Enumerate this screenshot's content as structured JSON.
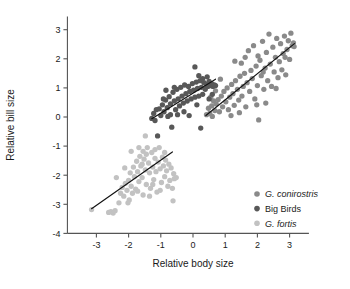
{
  "chart_data": {
    "type": "scatter",
    "title": "",
    "xlabel": "Relative body size",
    "ylabel": "Relative bill size",
    "xlim": [
      -3.9,
      3.6
    ],
    "ylim": [
      -4.0,
      3.45
    ],
    "xticks": [
      "-3",
      "-2",
      "-1",
      "0",
      "1",
      "2",
      "3"
    ],
    "xtick_values": [
      -3,
      -2,
      -1,
      0,
      1,
      2,
      3
    ],
    "yticks": [
      "3",
      "2",
      "1",
      "0",
      "-1",
      "-2",
      "-3",
      "-4"
    ],
    "ytick_values": [
      3,
      2,
      1,
      0,
      -1,
      -2,
      -3,
      -4
    ],
    "grid": false,
    "legend_position": "lower-right",
    "colors": {
      "g_conirostris": "#8a8a8a",
      "big_birds": "#585858",
      "g_fortis": "#c2c2c2",
      "fit_line": "#111111",
      "axis": "#555555"
    },
    "series": [
      {
        "name": "G. conirostris",
        "italic": true,
        "color": "#8a8a8a",
        "marker": "circle",
        "points": [
          [
            0.42,
            0.08
          ],
          [
            0.48,
            0.3
          ],
          [
            0.52,
            0.12
          ],
          [
            0.58,
            0.38
          ],
          [
            0.6,
            0.02
          ],
          [
            0.64,
            0.55
          ],
          [
            0.68,
            0.22
          ],
          [
            0.72,
            0.45
          ],
          [
            0.78,
            0.6
          ],
          [
            0.82,
            0.18
          ],
          [
            0.88,
            0.72
          ],
          [
            0.92,
            0.35
          ],
          [
            0.96,
            0.88
          ],
          [
            1.02,
            0.52
          ],
          [
            1.06,
            1.0
          ],
          [
            1.1,
            0.25
          ],
          [
            1.14,
            0.68
          ],
          [
            1.2,
            1.12
          ],
          [
            1.24,
            0.8
          ],
          [
            1.28,
            0.4
          ],
          [
            1.32,
            1.25
          ],
          [
            1.38,
            0.95
          ],
          [
            1.42,
            0.58
          ],
          [
            1.46,
            1.4
          ],
          [
            1.5,
            1.85
          ],
          [
            1.52,
            0.72
          ],
          [
            1.56,
            1.05
          ],
          [
            1.6,
            1.5
          ],
          [
            1.64,
            0.35
          ],
          [
            1.68,
            1.18
          ],
          [
            1.72,
            2.28
          ],
          [
            1.76,
            0.88
          ],
          [
            1.8,
            1.6
          ],
          [
            1.84,
            1.32
          ],
          [
            1.88,
            2.45
          ],
          [
            1.92,
            0.62
          ],
          [
            1.96,
            1.75
          ],
          [
            2.0,
            1.08
          ],
          [
            2.04,
            -0.1
          ],
          [
            2.08,
            1.95
          ],
          [
            2.12,
            1.42
          ],
          [
            2.16,
            2.6
          ],
          [
            2.2,
            0.95
          ],
          [
            2.24,
            1.68
          ],
          [
            2.28,
            2.22
          ],
          [
            2.32,
            1.25
          ],
          [
            2.36,
            2.85
          ],
          [
            2.4,
            1.82
          ],
          [
            2.44,
            1.05
          ],
          [
            2.48,
            2.4
          ],
          [
            2.52,
            1.55
          ],
          [
            2.56,
            2.05
          ],
          [
            2.6,
            2.7
          ],
          [
            2.64,
            1.35
          ],
          [
            2.68,
            1.9
          ],
          [
            2.72,
            2.52
          ],
          [
            2.76,
            1.62
          ],
          [
            2.8,
            2.18
          ],
          [
            2.84,
            2.78
          ],
          [
            2.88,
            1.45
          ],
          [
            2.92,
            2.32
          ],
          [
            2.96,
            2.62
          ],
          [
            3.0,
            1.98
          ],
          [
            3.04,
            2.88
          ],
          [
            3.08,
            2.45
          ],
          [
            3.12,
            2.55
          ],
          [
            3.14,
            2.42
          ],
          [
            1.3,
            1.92
          ],
          [
            0.85,
            1.3
          ],
          [
            1.44,
            0.15
          ],
          [
            2.02,
            2.1
          ],
          [
            2.26,
            0.48
          ],
          [
            1.18,
            0.05
          ],
          [
            0.7,
            0.9
          ],
          [
            2.58,
            0.98
          ],
          [
            1.62,
            2.05
          ],
          [
            2.18,
            1.55
          ],
          [
            0.55,
            0.68
          ],
          [
            1.98,
            0.42
          ],
          [
            2.86,
            2.05
          ]
        ]
      },
      {
        "name": "Big Birds",
        "italic": false,
        "color": "#585858",
        "marker": "circle",
        "points": [
          [
            -1.28,
            -0.05
          ],
          [
            -1.22,
            0.12
          ],
          [
            -1.18,
            -0.12
          ],
          [
            -1.1,
            -0.65
          ],
          [
            -1.05,
            0.28
          ],
          [
            -1.0,
            0.05
          ],
          [
            -0.95,
            0.42
          ],
          [
            -0.9,
            0.18
          ],
          [
            -0.85,
            0.58
          ],
          [
            -0.8,
            0.32
          ],
          [
            -0.78,
            0.02
          ],
          [
            -0.74,
            0.7
          ],
          [
            -0.7,
            0.45
          ],
          [
            -0.66,
            -0.35
          ],
          [
            -0.62,
            0.85
          ],
          [
            -0.58,
            0.55
          ],
          [
            -0.54,
            0.25
          ],
          [
            -0.5,
            0.95
          ],
          [
            -0.46,
            0.62
          ],
          [
            -0.42,
            0.38
          ],
          [
            -0.38,
            1.02
          ],
          [
            -0.34,
            0.72
          ],
          [
            -0.3,
            0.48
          ],
          [
            -0.26,
            1.1
          ],
          [
            -0.22,
            0.8
          ],
          [
            -0.18,
            0.55
          ],
          [
            -0.14,
            1.05
          ],
          [
            -0.1,
            0.88
          ],
          [
            -0.06,
            0.62
          ],
          [
            -0.02,
            1.15
          ],
          [
            0.02,
            0.92
          ],
          [
            0.06,
            0.68
          ],
          [
            0.1,
            1.2
          ],
          [
            0.14,
            0.98
          ],
          [
            0.18,
            0.72
          ],
          [
            0.22,
            1.25
          ],
          [
            0.26,
            1.02
          ],
          [
            0.3,
            0.78
          ],
          [
            0.34,
            1.18
          ],
          [
            0.38,
            0.95
          ],
          [
            0.42,
            1.12
          ],
          [
            0.46,
            1.05
          ],
          [
            0.5,
            1.22
          ],
          [
            0.54,
            1.08
          ],
          [
            0.58,
            1.15
          ],
          [
            0.62,
            1.05
          ],
          [
            0.66,
            1.1
          ],
          [
            0.7,
            1.08
          ],
          [
            0.06,
            1.72
          ],
          [
            -0.12,
            0.05
          ],
          [
            -0.48,
            0.08
          ],
          [
            -0.92,
            0.62
          ],
          [
            -0.58,
            1.02
          ],
          [
            0.18,
            1.42
          ],
          [
            0.3,
            1.32
          ],
          [
            0.44,
            1.38
          ],
          [
            -0.7,
            0.08
          ],
          [
            -0.28,
            0.18
          ],
          [
            0.12,
            0.42
          ],
          [
            0.5,
            0.62
          ],
          [
            0.24,
            -0.38
          ],
          [
            -0.84,
            0.92
          ],
          [
            -1.14,
            0.25
          ],
          [
            0.6,
            0.78
          ]
        ]
      },
      {
        "name": "G. fortis",
        "italic": true,
        "color": "#c2c2c2",
        "marker": "circle",
        "points": [
          [
            -3.15,
            -3.18
          ],
          [
            -2.62,
            -3.28
          ],
          [
            -2.55,
            -3.25
          ],
          [
            -2.48,
            -3.3
          ],
          [
            -2.42,
            -3.22
          ],
          [
            -2.3,
            -2.95
          ],
          [
            -2.25,
            -2.62
          ],
          [
            -2.2,
            -2.42
          ],
          [
            -2.15,
            -2.72
          ],
          [
            -2.1,
            -2.28
          ],
          [
            -2.05,
            -2.52
          ],
          [
            -2.0,
            -2.18
          ],
          [
            -1.98,
            -2.85
          ],
          [
            -1.95,
            -1.92
          ],
          [
            -1.92,
            -2.38
          ],
          [
            -1.88,
            -2.62
          ],
          [
            -1.85,
            -1.72
          ],
          [
            -1.82,
            -2.05
          ],
          [
            -1.78,
            -2.48
          ],
          [
            -1.75,
            -1.52
          ],
          [
            -1.72,
            -1.88
          ],
          [
            -1.68,
            -2.22
          ],
          [
            -1.65,
            -1.35
          ],
          [
            -1.62,
            -1.68
          ],
          [
            -1.58,
            -2.08
          ],
          [
            -1.55,
            -1.18
          ],
          [
            -1.52,
            -1.45
          ],
          [
            -1.48,
            -1.82
          ],
          [
            -1.45,
            -2.32
          ],
          [
            -1.42,
            -1.05
          ],
          [
            -1.38,
            -1.58
          ],
          [
            -1.35,
            -1.92
          ],
          [
            -1.32,
            -2.45
          ],
          [
            -1.28,
            -1.22
          ],
          [
            -1.25,
            -1.72
          ],
          [
            -1.22,
            -2.15
          ],
          [
            -1.18,
            -1.42
          ],
          [
            -1.15,
            -1.88
          ],
          [
            -1.12,
            -2.58
          ],
          [
            -1.08,
            -1.55
          ],
          [
            -1.05,
            -1.05
          ],
          [
            -1.02,
            -1.78
          ],
          [
            -0.98,
            -2.25
          ],
          [
            -0.95,
            -1.38
          ],
          [
            -0.92,
            -1.68
          ],
          [
            -0.88,
            -2.05
          ],
          [
            -0.85,
            -1.48
          ],
          [
            -0.82,
            -1.85
          ],
          [
            -0.78,
            -2.38
          ],
          [
            -0.75,
            -1.62
          ],
          [
            -0.72,
            -2.18
          ],
          [
            -0.68,
            -1.75
          ],
          [
            -0.64,
            -2.45
          ],
          [
            -0.6,
            -1.95
          ],
          [
            -0.58,
            -2.12
          ],
          [
            -0.62,
            -2.88
          ],
          [
            -1.48,
            -0.65
          ],
          [
            -2.12,
            -1.75
          ],
          [
            -1.92,
            -1.18
          ],
          [
            -1.55,
            -2.68
          ],
          [
            -1.35,
            -2.72
          ],
          [
            -2.38,
            -2.08
          ],
          [
            -1.68,
            -1.05
          ],
          [
            -0.52,
            -2.08
          ],
          [
            -1.25,
            -2.32
          ],
          [
            -1.72,
            -2.55
          ],
          [
            -2.02,
            -2.95
          ],
          [
            -1.02,
            -2.52
          ],
          [
            -1.58,
            -1.62
          ],
          [
            -1.18,
            -1.12
          ],
          [
            -0.88,
            -1.22
          ],
          [
            -1.45,
            -1.28
          ]
        ]
      }
    ],
    "fit_lines": [
      {
        "series": "G. fortis",
        "x1": -3.15,
        "y1": -3.15,
        "x2": -0.64,
        "y2": -1.2
      },
      {
        "series": "Big Birds",
        "x1": -1.28,
        "y1": -0.06,
        "x2": 0.7,
        "y2": 1.3
      },
      {
        "series": "G. conirostris",
        "x1": 0.4,
        "y1": 0.05,
        "x2": 3.15,
        "y2": 2.52
      }
    ]
  },
  "legend": {
    "entries": [
      {
        "label": "G. conirostris",
        "italic": true,
        "color": "#8a8a8a"
      },
      {
        "label": "Big Birds",
        "italic": false,
        "color": "#585858"
      },
      {
        "label": "G. fortis",
        "italic": true,
        "color": "#c2c2c2"
      }
    ]
  },
  "axes": {
    "x_title": "Relative body size",
    "y_title": "Relative bill size"
  }
}
